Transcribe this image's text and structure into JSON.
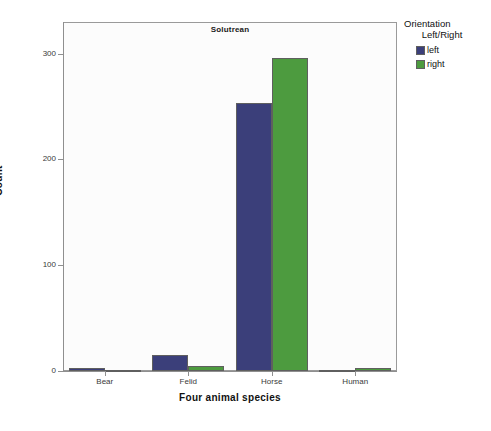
{
  "chart_data": {
    "type": "bar",
    "title": "Solutrean",
    "xlabel": "Four animal species",
    "ylabel": "Count",
    "categories": [
      "Bear",
      "Felid",
      "Horse",
      "Human"
    ],
    "series": [
      {
        "name": "left",
        "color": "#3b3f7a",
        "values": [
          3,
          15,
          253,
          0
        ]
      },
      {
        "name": "right",
        "color": "#4d9b3f",
        "values": [
          0,
          5,
          296,
          3
        ]
      }
    ],
    "ylim": [
      0,
      330
    ],
    "yticks": [
      0,
      100,
      200,
      300
    ],
    "ytick_labels": [
      "0",
      "100",
      "200",
      "300"
    ],
    "grid": false,
    "legend": {
      "title_line1": "Orientation",
      "title_line2": "Left/Right",
      "position": "right"
    }
  }
}
